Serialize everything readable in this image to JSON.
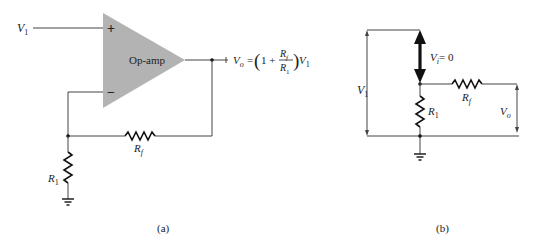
{
  "figure_a": {
    "caption": "(a)",
    "input_label": "V",
    "input_sub": "1",
    "opamp_label": "Op-amp",
    "plus_sign": "+",
    "minus_sign": "−",
    "output_eq": {
      "lhs": "V",
      "lhs_sub": "o",
      "equals": "=",
      "open_paren": "(",
      "one_plus": "1 +",
      "num": "R",
      "num_sub": "f",
      "den": "R",
      "den_sub": "1",
      "close_paren": ")",
      "rhs": "V",
      "rhs_sub": "1"
    },
    "rf_label": "R",
    "rf_sub": "f",
    "r1_label": "R",
    "r1_sub": "1",
    "colors": {
      "opamp_fill": "#b3b3b3",
      "wire": "#444444"
    }
  },
  "figure_b": {
    "caption": "(b)",
    "v1_label": "V",
    "v1_sub": "1",
    "vi_label": "V",
    "vi_sub": "i",
    "vi_value": "= 0",
    "rf_label": "R",
    "rf_sub": "f",
    "r1_label": "R",
    "r1_sub": "1",
    "vo_label": "V",
    "vo_sub": "o"
  }
}
